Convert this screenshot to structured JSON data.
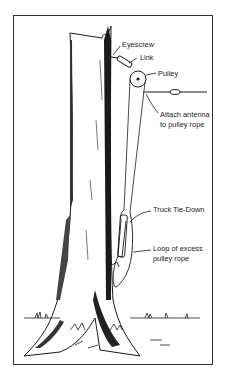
{
  "diagram": {
    "labels": {
      "eyescrew": "Eyescrew",
      "link": "Link",
      "pulley": "Pulley",
      "attach_line1": "Attach antenna",
      "attach_line2": "to pulley rope",
      "tie_down": "Truck Tie-Down",
      "loop_line1": "Loop of excess",
      "loop_line2": "pulley rope"
    },
    "colors": {
      "ink": "#1a1a1a",
      "frame": "#333333",
      "background": "#ffffff"
    }
  }
}
